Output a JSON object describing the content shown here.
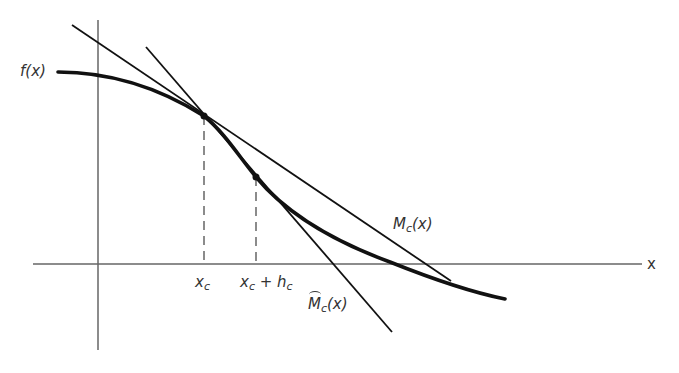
{
  "diagram": {
    "title": "",
    "labels": {
      "function": "f(x)",
      "x_axis": "x",
      "xc_base": "x",
      "xc_sub": "c",
      "xch_base": "x",
      "xch_sub1": "c",
      "xch_plus": " + h",
      "xch_sub2": "c",
      "tangent_base": "M",
      "tangent_sub": "c",
      "tangent_arg": "(x)",
      "secant_base": "M",
      "secant_sub": "c",
      "secant_arg": "(x)"
    },
    "elements": {
      "curve": "f(x) decreasing concave-then-convex curve",
      "tangent_line": "M_c(x) tangent at x_c",
      "secant_line": "hat M_c(x) secant through x_c and x_c + h_c",
      "point_1": "x_c",
      "point_2": "x_c + h_c"
    },
    "colors": {
      "ink": "#111111",
      "axis": "#555555",
      "text": "#333333"
    }
  }
}
